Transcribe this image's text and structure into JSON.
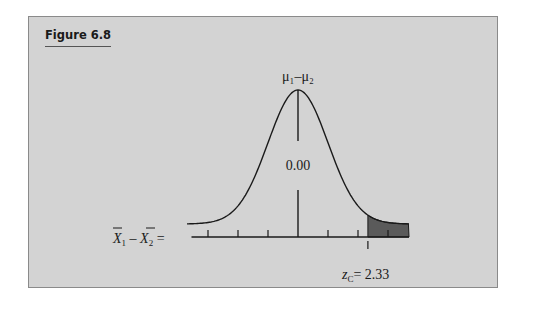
{
  "figure": {
    "title": "Figure 6.8"
  },
  "chart_data": {
    "type": "area",
    "title": "Figure 6.8",
    "mean_label": "μ₁–μ₂",
    "center_value": "0.00",
    "xlabel": "X̄₁ – X̄₂ =",
    "critical_label": "z",
    "critical_subscript": "C",
    "critical_value": 2.33,
    "critical_text": "= 2.33",
    "shaded_region": "upper tail, z > 2.33",
    "ticks_z": [
      -3,
      -2,
      -1,
      0,
      1,
      2,
      3
    ],
    "xlim_z": [
      -3.7,
      3.7
    ],
    "grid": false,
    "legend": null,
    "colors": {
      "background": "#d3d3d3",
      "curve": "#1a1a1a",
      "shade": "#5a5a5a"
    }
  }
}
